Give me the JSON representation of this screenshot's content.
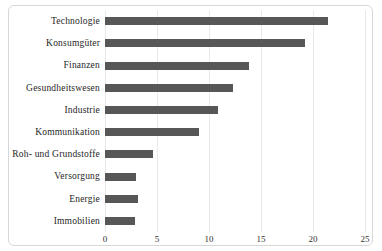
{
  "chart_data": {
    "type": "bar",
    "orientation": "horizontal",
    "title": "",
    "xlabel": "",
    "ylabel": "",
    "categories": [
      "Technologie",
      "Konsumgüter",
      "Finanzen",
      "Gesundheitswesen",
      "Industrie",
      "Kommunikation",
      "Roh- und Grundstoffe",
      "Versorgung",
      "Energie",
      "Immobilien"
    ],
    "values": [
      21.4,
      19.2,
      13.8,
      12.3,
      10.9,
      9.0,
      4.6,
      3.0,
      3.2,
      2.9
    ],
    "xlim": [
      0,
      25
    ],
    "xticks": [
      0,
      5,
      10,
      15,
      20,
      25
    ],
    "xtick_labels": [
      "0",
      "5",
      "10",
      "15",
      "20",
      "25"
    ],
    "grid": "vertical-on",
    "legend": "none",
    "bar_color": "#575757"
  },
  "colors": {
    "background": "#ffffff",
    "frame_border": "#d7d7d7",
    "gridline": "#e9e9e9",
    "text": "#262626",
    "bar": "#575757"
  }
}
